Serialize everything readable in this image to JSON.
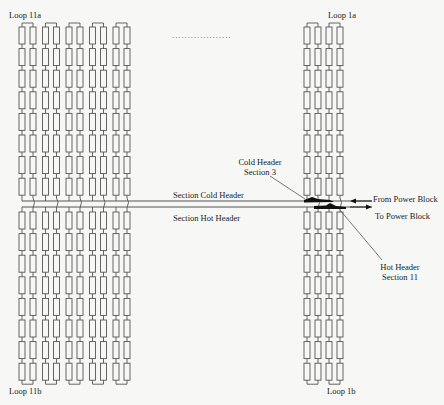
{
  "labels": {
    "loop_11a": "Loop 11a",
    "loop_11b": "Loop 11b",
    "loop_1a": "Loop 1a",
    "loop_1b": "Loop 1b",
    "section_cold_header": "Section Cold Header",
    "section_hot_header": "Section Hot Header",
    "cold_header_section_line1": "Cold Header",
    "cold_header_section_line2": "Section 3",
    "hot_header_section_line1": "Hot Header",
    "hot_header_section_line2": "Section 11",
    "from_power_block": "From Power Block",
    "to_power_block": "To Power Block",
    "ellipsis": "..................."
  },
  "layout": {
    "left_group": {
      "tubes": 10,
      "x_start": 19,
      "pair_pitch": 23.5,
      "tube_pitch": 11
    },
    "right_group": {
      "tubes": 4,
      "x_start": 304,
      "pair_pitch": 22,
      "tube_pitch": 11
    },
    "rows_per_section": 8,
    "upper_y": 27,
    "lower_y": 212,
    "row_pitch": 21.6,
    "cold_header_y": 201,
    "hot_header_y": 207
  },
  "colors": {
    "line": "#555555",
    "ink": "#111111",
    "background": "#f7f7f5"
  }
}
